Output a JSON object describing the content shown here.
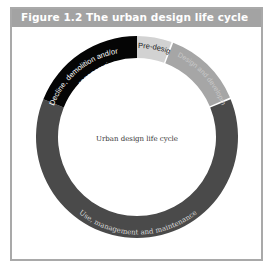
{
  "figure": {
    "title": "Figure 1.2  The urban design life cycle",
    "center_label": "Urban design life cycle",
    "segments": [
      {
        "label": "Pre-design",
        "color": "#d2d2d2",
        "text_color": "#222222",
        "start_deg": 0,
        "end_deg": 20
      },
      {
        "label": "Design and development",
        "color": "#a6a6a6",
        "text_color": "#cfcfcf",
        "start_deg": 21,
        "end_deg": 67
      },
      {
        "label": "Use, management and maintenance",
        "color": "#4a4a4a",
        "text_color": "#d8d8d8",
        "start_deg": 68,
        "end_deg": 292
      },
      {
        "label_line1": "Decline, demolition and/or",
        "label_line2": "regeneration",
        "color": "#050505",
        "text_color": "#ffffff",
        "start_deg": 292,
        "end_deg": 360
      }
    ]
  },
  "colors": {
    "header_bg": "#a3a3a3",
    "frame_border": "#a9a9a9"
  }
}
